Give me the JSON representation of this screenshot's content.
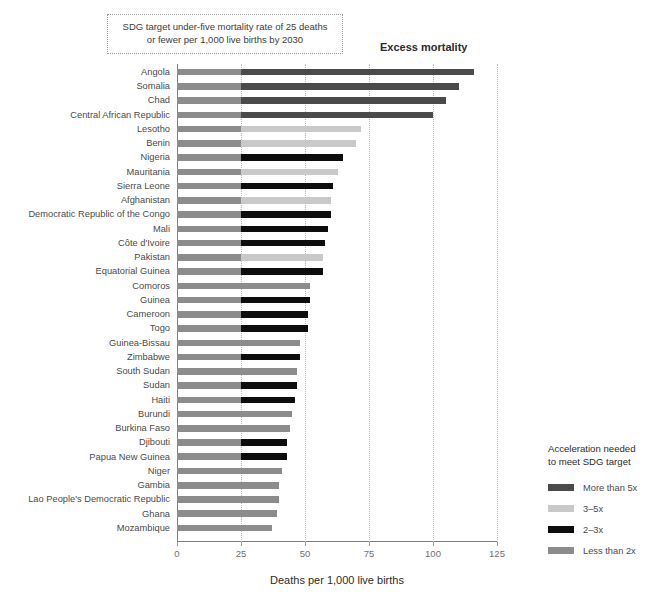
{
  "annotations": {
    "sdg_note_line1": "SDG target under-five mortality rate of 25 deaths",
    "sdg_note_line2": "or fewer per 1,000 live births by 2030",
    "excess_mortality_label": "Excess mortality"
  },
  "legend": {
    "title_line1": "Acceleration needed",
    "title_line2": "to meet SDG target",
    "items": [
      {
        "label": "More than 5x",
        "color": "#4a4a4a"
      },
      {
        "label": "3–5x",
        "color": "#c9c9c9"
      },
      {
        "label": "2–3x",
        "color": "#0d0d0d"
      },
      {
        "label": "Less than 2x",
        "color": "#8c8c8c"
      }
    ]
  },
  "chart_data": {
    "type": "bar",
    "orientation": "horizontal",
    "stacked": true,
    "title": "",
    "xlabel": "Deaths per 1,000 live births",
    "ylabel": "",
    "xlim": [
      0,
      125
    ],
    "xticks": [
      0,
      25,
      50,
      75,
      100,
      125
    ],
    "grid": true,
    "grid_axis": "x",
    "legend_position": "right",
    "sdg_threshold": 25,
    "base_segment_label": "Within SDG target (0–25)",
    "base_segment_color": "#8c8c8c",
    "categories": [
      "Angola",
      "Somalia",
      "Chad",
      "Central African Republic",
      "Lesotho",
      "Benin",
      "Nigeria",
      "Mauritania",
      "Sierra Leone",
      "Afghanistan",
      "Democratic Republic of the Congo",
      "Mali",
      "Côte d'Ivoire",
      "Pakistan",
      "Equatorial Guinea",
      "Comoros",
      "Guinea",
      "Cameroon",
      "Togo",
      "Guinea-Bissau",
      "Zimbabwe",
      "South Sudan",
      "Sudan",
      "Haiti",
      "Burundi",
      "Burkina Faso",
      "Djibouti",
      "Papua New Guinea",
      "Niger",
      "Gambia",
      "Lao People's Democratic Republic",
      "Ghana",
      "Mozambique"
    ],
    "values": [
      116,
      110,
      105,
      100,
      72,
      70,
      65,
      63,
      61,
      60,
      60,
      59,
      58,
      57,
      57,
      52,
      52,
      51,
      51,
      48,
      48,
      47,
      47,
      46,
      45,
      44,
      43,
      43,
      41,
      40,
      40,
      39,
      37
    ],
    "acceleration_category": [
      "More than 5x",
      "More than 5x",
      "More than 5x",
      "More than 5x",
      "3–5x",
      "3–5x",
      "2–3x",
      "3–5x",
      "2–3x",
      "3–5x",
      "2–3x",
      "2–3x",
      "2–3x",
      "3–5x",
      "2–3x",
      "Less than 2x",
      "2–3x",
      "2–3x",
      "2–3x",
      "Less than 2x",
      "2–3x",
      "Less than 2x",
      "2–3x",
      "2–3x",
      "Less than 2x",
      "Less than 2x",
      "2–3x",
      "2–3x",
      "Less than 2x",
      "Less than 2x",
      "Less than 2x",
      "Less than 2x",
      "Less than 2x"
    ]
  }
}
